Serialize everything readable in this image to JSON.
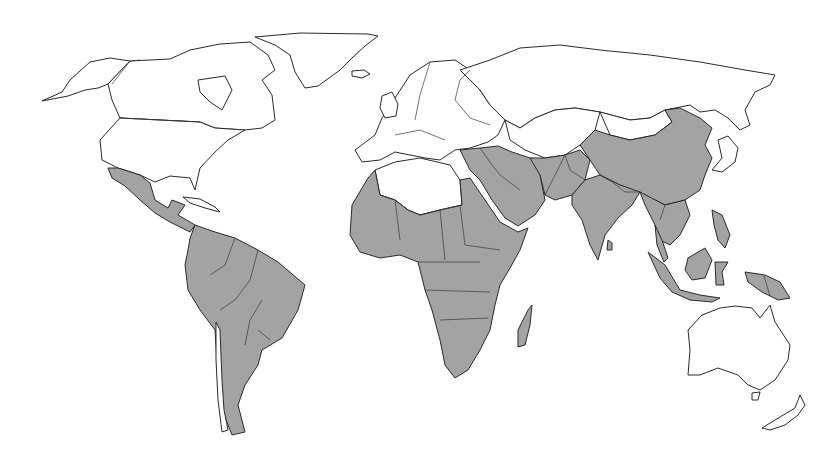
{
  "map": {
    "type": "world-choropleth",
    "projection": "equirectangular-like",
    "background_color": "#ffffff",
    "outline_color": "#2a2a2a",
    "categories": [
      {
        "id": "shaded",
        "fill": "#a3a3a3"
      },
      {
        "id": "unshaded",
        "fill": "#ffffff"
      }
    ],
    "regions": [
      {
        "name": "greenland",
        "category": "unshaded",
        "path": "M255 37 L300 33 L368 34 L378 36 L365 46 L352 58 L340 70 L318 86 L305 88 L295 72 L290 55 L275 45 Z"
      },
      {
        "name": "iceland",
        "category": "unshaded",
        "path": "M352 71 L364 70 L370 74 L362 78 L352 76 Z"
      },
      {
        "name": "alaska",
        "category": "unshaded",
        "path": "M42 101 L62 92 L70 80 L90 62 L110 58 L130 61 L108 84 L98 88 L85 90 L68 96 Z"
      },
      {
        "name": "canada",
        "category": "unshaded",
        "path": "M130 61 L170 59 L190 50 L220 44 L250 42 L268 55 L275 70 L262 80 L272 95 L275 120 L262 128 L245 130 L215 128 L200 122 L120 118 L112 100 L108 84 Z"
      },
      {
        "name": "hudson-bay",
        "category": "unshaded-water",
        "path": "M198 80 L225 76 L232 90 L222 110 L210 102 L200 92 Z"
      },
      {
        "name": "usa",
        "category": "unshaded",
        "path": "M120 118 L200 122 L215 128 L245 130 L228 140 L215 152 L200 168 L195 190 L190 178 L170 176 L155 182 L140 175 L118 168 L102 160 L100 140 Z"
      },
      {
        "name": "mexico-central-america",
        "category": "shaded",
        "path": "M108 168 L118 168 L140 175 L150 183 L155 200 L168 208 L172 200 L185 205 L178 215 L195 225 L190 232 L182 228 L170 222 L155 213 L140 200 L125 186 L112 178 Z"
      },
      {
        "name": "caribbean-cuba",
        "category": "unshaded",
        "path": "M183 197 L200 199 L215 207 L220 212 L205 208 L190 203 Z"
      },
      {
        "name": "south-america",
        "category": "shaded",
        "path": "M195 225 L215 232 L235 238 L258 250 L278 262 L305 285 L298 310 L282 338 L262 350 L258 365 L245 385 L238 405 L245 432 L232 435 L222 410 L218 380 L215 330 L200 310 L188 290 L185 265 L188 250 L190 238 Z"
      },
      {
        "name": "chile",
        "category": "unshaded",
        "path": "M216 322 L220 330 L222 380 L224 410 L228 430 L222 432 L218 400 L216 360 Z"
      },
      {
        "name": "europe",
        "category": "unshaded",
        "path": "M355 150 L375 135 L382 118 L395 98 L410 75 L430 62 L455 60 L470 70 L480 90 L490 105 L505 120 L498 135 L488 142 L470 148 L455 150 L440 160 L425 158 L410 155 L395 152 L380 160 L362 162 Z"
      },
      {
        "name": "uk-ireland",
        "category": "unshaded",
        "path": "M382 96 L392 92 L398 104 L396 116 L385 118 L380 108 Z"
      },
      {
        "name": "russia-north-asia",
        "category": "unshaded",
        "path": "M460 70 L490 60 L520 48 L560 45 L600 50 L650 55 L700 62 L745 70 L775 75 L770 85 L755 92 L745 110 L750 125 L740 130 L728 118 L715 110 L700 112 L690 105 L665 110 L650 118 L630 120 L600 112 L575 108 L555 110 L535 118 L520 128 L505 120 L490 105 L480 90 Z"
      },
      {
        "name": "kazakhstan-central-asia",
        "category": "unshaded",
        "path": "M505 120 L520 128 L535 118 L555 110 L575 108 L600 112 L595 130 L580 145 L565 155 L545 158 L525 150 L510 140 Z"
      },
      {
        "name": "mongolia",
        "category": "unshaded",
        "path": "M600 112 L630 120 L650 118 L665 110 L672 122 L655 135 L630 140 L610 135 Z"
      },
      {
        "name": "japan",
        "category": "unshaded",
        "path": "M718 140 L728 136 L738 148 L735 162 L722 172 L712 170 L722 158 Z"
      },
      {
        "name": "north-africa-white",
        "category": "unshaded",
        "path": "M375 170 L395 162 L420 158 L450 165 L460 180 L462 205 L440 210 L420 215 L408 210 L395 200 L380 195 Z"
      },
      {
        "name": "africa-shaded",
        "category": "shaded",
        "path": "M352 205 L368 178 L375 170 L380 195 L395 200 L408 210 L420 215 L440 210 L462 205 L460 180 L470 178 L485 200 L500 222 L518 232 L528 228 L520 250 L510 268 L500 285 L495 305 L490 330 L480 350 L468 370 L455 378 L445 365 L440 340 L432 310 L425 290 L418 262 L400 255 L380 258 L360 252 L350 235 Z"
      },
      {
        "name": "madagascar",
        "category": "shaded",
        "path": "M528 310 L532 305 L530 325 L525 345 L518 347 L518 330 Z"
      },
      {
        "name": "middle-east",
        "category": "shaded",
        "path": "M460 150 L480 148 L498 146 L512 152 L530 158 L545 160 L540 175 L545 200 L535 215 L518 226 L505 218 L492 200 L480 180 L470 170 Z"
      },
      {
        "name": "iran-afghanistan-pakistan",
        "category": "shaded",
        "path": "M530 158 L545 158 L565 155 L580 150 L590 160 L585 180 L572 195 L555 200 L545 195 L540 175 Z"
      },
      {
        "name": "china",
        "category": "shaded",
        "path": "M580 145 L595 130 L610 135 L630 140 L655 135 L672 122 L665 110 L680 108 L700 118 L712 128 L705 145 L712 158 L705 175 L700 190 L685 200 L665 205 L645 195 L620 185 L600 175 L590 160 Z"
      },
      {
        "name": "india-south-asia",
        "category": "shaded",
        "path": "M572 195 L585 180 L600 175 L620 185 L640 192 L632 205 L618 218 L605 235 L598 260 L590 245 L582 220 L572 205 Z"
      },
      {
        "name": "sri-lanka",
        "category": "shaded",
        "path": "M608 240 L612 243 L612 250 L607 250 Z"
      },
      {
        "name": "southeast-asia",
        "category": "shaded",
        "path": "M640 192 L665 205 L685 200 L690 215 L680 235 L670 245 L660 240 L655 225 L650 215 L645 205 Z"
      },
      {
        "name": "malay-peninsula",
        "category": "shaded",
        "path": "M655 225 L662 240 L668 258 L664 262 L657 245 Z"
      },
      {
        "name": "sumatra-java",
        "category": "shaded",
        "path": "M648 252 L665 265 L680 290 L700 295 L720 298 L712 302 L690 300 L672 292 L660 278 Z"
      },
      {
        "name": "borneo",
        "category": "shaded",
        "path": "M688 258 L705 248 L712 260 L705 278 L692 280 L685 270 Z"
      },
      {
        "name": "sulawesi",
        "category": "shaded",
        "path": "M715 262 L728 262 L722 272 L724 285 L716 285 Z"
      },
      {
        "name": "philippines",
        "category": "shaded",
        "path": "M712 210 L722 215 L730 235 L725 248 L718 240 L714 225 Z"
      },
      {
        "name": "new-guinea",
        "category": "shaded",
        "path": "M745 272 L765 275 L780 282 L790 298 L778 300 L762 292 L748 282 Z"
      },
      {
        "name": "australia",
        "category": "unshaded",
        "path": "M688 330 L702 315 L720 308 L735 306 L752 308 L760 318 L770 305 L775 322 L790 345 L788 360 L775 380 L760 390 L748 385 L738 375 L718 368 L700 375 L688 375 L690 350 Z"
      },
      {
        "name": "tasmania",
        "category": "unshaded",
        "path": "M752 393 L760 392 L758 400 L752 400 Z"
      },
      {
        "name": "new-zealand",
        "category": "unshaded",
        "path": "M800 395 L805 405 L798 415 L785 425 L770 430 L762 428 L775 420 L795 408 Z"
      }
    ],
    "borders": [
      "M140 60 L130 61 L112 84",
      "M120 118 L200 122",
      "M380 195 L395 200 L408 210",
      "M420 215 L440 210 L462 205",
      "M395 200 L400 240",
      "M440 210 L445 260",
      "M418 262 L480 262",
      "M460 205 L465 245 L500 250",
      "M425 290 L490 292",
      "M440 320 L488 318",
      "M565 155 L570 170 L585 180",
      "M545 195 L555 175 L565 155",
      "M480 148 L492 165 L500 175 L520 190",
      "M600 175 L612 182 L625 192 L640 192",
      "M665 205 L660 220",
      "M235 238 L225 265 L210 275",
      "M258 250 L250 280 L235 300 L220 310",
      "M262 300 L250 320 L245 345",
      "M258 330 L270 340",
      "M764 276 L770 296",
      "M470 70 L460 80 L455 100 L470 118 L490 125",
      "M430 62 L420 95 L415 120",
      "M395 135 L420 130 L445 140"
    ]
  }
}
